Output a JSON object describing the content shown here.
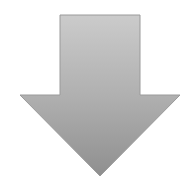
{
  "graphic": {
    "icon": "arrow-down-icon",
    "direction": "down",
    "colors": {
      "top": "#cacaca",
      "bottom": "#939393",
      "edge": "#8a8a8a",
      "background": "#ffffff"
    }
  }
}
